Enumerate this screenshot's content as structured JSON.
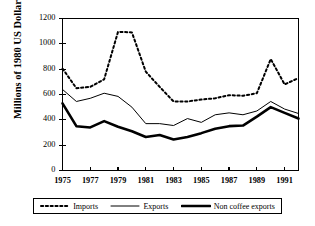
{
  "chart_data": {
    "type": "line",
    "title": "",
    "xlabel": "",
    "ylabel": "Millions of 1980 US Dollars",
    "xlim": [
      1975,
      1992
    ],
    "ylim": [
      0,
      1200
    ],
    "grid": false,
    "legend_position": "bottom",
    "x": [
      1975,
      1976,
      1977,
      1978,
      1979,
      1980,
      1981,
      1982,
      1983,
      1984,
      1985,
      1986,
      1987,
      1988,
      1989,
      1990,
      1991,
      1992
    ],
    "y_ticks": [
      0,
      200,
      400,
      600,
      800,
      1000,
      1200
    ],
    "x_ticks": [
      1975,
      1977,
      1979,
      1981,
      1983,
      1985,
      1987,
      1989,
      1991
    ],
    "x_tick_labels": [
      "1975",
      "1977",
      "1979",
      "1981",
      "1983",
      "1985",
      "1987",
      "1989",
      "1991"
    ],
    "y_tick_labels": [
      "0",
      "200",
      "400",
      "600",
      "800",
      "1000",
      "1200"
    ],
    "series": [
      {
        "name": "Imports",
        "style": "dotted",
        "color": "#000000",
        "width": 2.0,
        "values": [
          805,
          650,
          660,
          720,
          1095,
          1090,
          780,
          660,
          545,
          545,
          560,
          570,
          595,
          590,
          610,
          880,
          680,
          730
        ]
      },
      {
        "name": "Exports",
        "style": "solid-thin",
        "color": "#000000",
        "width": 1.0,
        "values": [
          640,
          545,
          570,
          610,
          585,
          500,
          370,
          370,
          355,
          410,
          380,
          440,
          455,
          440,
          470,
          545,
          485,
          450
        ]
      },
      {
        "name": "Non coffee exports",
        "style": "solid-thick",
        "color": "#000000",
        "width": 2.6,
        "values": [
          530,
          350,
          340,
          390,
          345,
          310,
          265,
          280,
          245,
          265,
          295,
          330,
          350,
          355,
          425,
          500,
          455,
          410
        ]
      }
    ]
  },
  "legend": {
    "entries": [
      {
        "label": "Imports",
        "swatch": "dotted-line-swatch"
      },
      {
        "label": "Exports",
        "swatch": "thin-line-swatch"
      },
      {
        "label": "Non coffee exports",
        "swatch": "thick-line-swatch"
      }
    ]
  }
}
